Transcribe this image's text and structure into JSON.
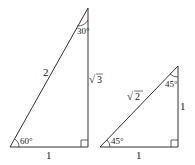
{
  "triangle1": {
    "hypotenuse": "2",
    "base": "1",
    "height_label": "√3",
    "height_sqrt": "3",
    "angle_bottom": "60°",
    "angle_top": "30°"
  },
  "triangle2": {
    "hypotenuse_sqrt": "2",
    "base": "1",
    "height": "1",
    "angle_bottom": "45°",
    "angle_top": "45°"
  },
  "colors": {
    "stroke": "#333333"
  }
}
